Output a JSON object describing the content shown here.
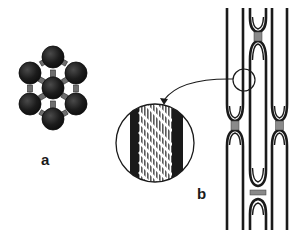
{
  "figure": {
    "panel_a": {
      "label": "a",
      "description": "hexagonal cluster of seven spheres linked by rectangular connectors",
      "sphere_color": "#1c1c1c",
      "connector_color": "#6e6e6e"
    },
    "panel_b": {
      "label": "b",
      "description": "three parallel fibers with looped segments joined by connectors; magnified inset shows striated cross-section",
      "line_color": "#1a1a1a",
      "connector_color": "#8a8a8a",
      "inset": {
        "description": "magnified view of fiber wall with diagonal striations",
        "icon": "magnifier-circle"
      },
      "arrow": {
        "description": "curved arrow from small circle on fiber to magnified inset",
        "icon": "curved-arrow"
      }
    }
  }
}
